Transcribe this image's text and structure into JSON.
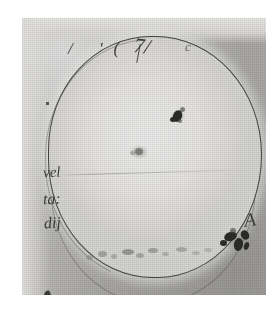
{
  "document": {
    "kind": "historical-sunspot-drawing-scan",
    "medium": "halftone print of ink-on-paper manuscript drawing",
    "paper_color": "#a9a8a6",
    "disc_color": "#e6e5e4",
    "ink_color": "#2e2e2b",
    "page_background": "#ffffff"
  },
  "annotations": {
    "top_line": "/  '(     ",
    "top_stroke": "7/",
    "top_right": "c",
    "left_line_1": "vel",
    "left_line_2": "ta:",
    "left_line_3": "dij",
    "spot_group_label": "A"
  },
  "drawing": {
    "disc_label": "solar-disc",
    "outline_style": "double pen stroke, slightly irregular circle",
    "equator_line": "faint horizontal line across mid-disc"
  },
  "chart_data": {
    "type": "scatter",
    "xlabel": "disc x (fraction of radius, +East)",
    "ylabel": "disc y (fraction of radius, +North)",
    "xlim": [
      -1,
      1
    ],
    "ylim": [
      -1,
      1
    ],
    "grid": false,
    "legend": "none",
    "annotations": [
      "A"
    ],
    "series": [
      {
        "name": "sunspot groups",
        "points": [
          {
            "label": "upper spot",
            "x": 0.28,
            "y": 0.52,
            "size": "small",
            "darkness": "dark",
            "count": 4
          },
          {
            "label": "central diffuse spot",
            "x": -0.1,
            "y": 0.17,
            "size": "small",
            "darkness": "faint",
            "count": 2
          },
          {
            "label": "A",
            "x": 0.72,
            "y": -0.48,
            "size": "large",
            "darkness": "dark",
            "count": 6
          },
          {
            "label": "lower band",
            "x": -0.25,
            "y": -0.7,
            "size": "scattered",
            "darkness": "very faint",
            "count": 10
          }
        ]
      }
    ]
  }
}
